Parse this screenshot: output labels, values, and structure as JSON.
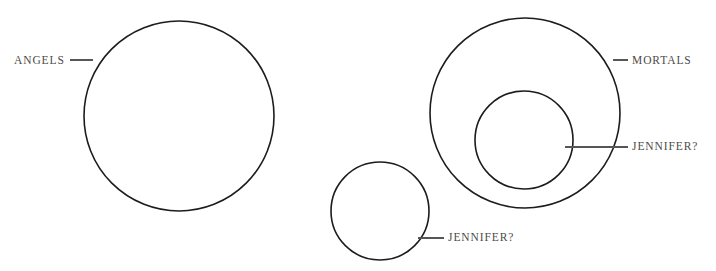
{
  "diagram": {
    "type": "euler-circle-diagram",
    "background_color": "#ffffff",
    "stroke_color": "#1c1c1c",
    "label_color": "#4d4a48",
    "leader_color": "#565656",
    "labels": {
      "angels": "ANGELS",
      "mortals": "MORTALS",
      "jennifer_inner": "JENNIFER?",
      "jennifer_small": "JENNIFER?"
    },
    "shapes": [
      {
        "name": "angels-circle",
        "cx": 179,
        "cy": 116,
        "r": 95
      },
      {
        "name": "mortals-circle",
        "cx": 525,
        "cy": 113,
        "r": 95
      },
      {
        "name": "jennifer-inner-circle",
        "cx": 524,
        "cy": 140,
        "r": 49
      },
      {
        "name": "jennifer-small-circle",
        "cx": 380,
        "cy": 211,
        "r": 49
      }
    ],
    "leaders": [
      {
        "name": "angels-leader",
        "x1": 70,
        "y1": 60,
        "x2": 93,
        "y2": 60
      },
      {
        "name": "mortals-leader",
        "x1": 613,
        "y1": 60,
        "x2": 628,
        "y2": 60
      },
      {
        "name": "jennifer-inner-leader",
        "x1": 565,
        "y1": 147,
        "x2": 628,
        "y2": 147
      },
      {
        "name": "jennifer-small-leader",
        "x1": 418,
        "y1": 238,
        "x2": 444,
        "y2": 238
      }
    ]
  }
}
